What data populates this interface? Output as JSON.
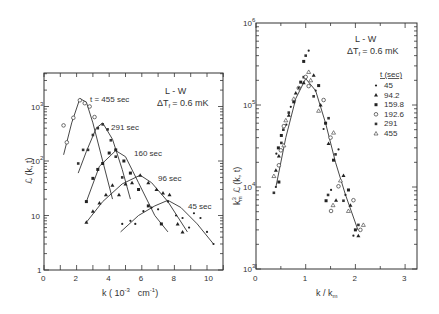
{
  "chart_data": [
    {
      "type": "scatter",
      "panel": "left",
      "title": "L - W",
      "subtitle": "ΔT_f = 0.6 mK",
      "xlabel": "k ( 10^-3  cm^-1 )",
      "ylabel": "ℒ (k, t)",
      "xlim": [
        0,
        11
      ],
      "ylim": [
        1,
        3000
      ],
      "yscale": "log",
      "xticks": [
        "0",
        "2",
        "4",
        "6",
        "8",
        "10"
      ],
      "yticks": [
        "1",
        "10",
        "10²",
        "10³"
      ],
      "series": [
        {
          "name": "t = 455 sec",
          "marker": "open-circle",
          "points": [
            [
              1.2,
              450
            ],
            [
              1.4,
              220
            ],
            [
              1.8,
              620
            ],
            [
              2.2,
              1300
            ],
            [
              2.5,
              1150
            ],
            [
              2.8,
              1000
            ],
            [
              3.1,
              640
            ]
          ],
          "curve": [
            [
              1.2,
              130
            ],
            [
              1.7,
              500
            ],
            [
              2.2,
              1400
            ],
            [
              2.6,
              1200
            ],
            [
              3.0,
              500
            ],
            [
              3.6,
              100
            ],
            [
              4.2,
              20
            ]
          ]
        },
        {
          "name": "291 sec",
          "marker": "square",
          "points": [
            [
              2.1,
              90
            ],
            [
              2.4,
              160
            ],
            [
              2.7,
              160
            ],
            [
              3.0,
              300
            ],
            [
              3.3,
              400
            ],
            [
              3.6,
              470
            ],
            [
              3.9,
              380
            ],
            [
              4.1,
              240
            ],
            [
              4.4,
              120
            ],
            [
              4.8,
              50
            ]
          ],
          "curve": [
            [
              2.1,
              60
            ],
            [
              2.6,
              150
            ],
            [
              3.2,
              400
            ],
            [
              3.6,
              500
            ],
            [
              4.2,
              250
            ],
            [
              4.8,
              70
            ],
            [
              5.3,
              20
            ]
          ]
        },
        {
          "name": "160 sec",
          "marker": "filled-square",
          "points": [
            [
              2.6,
              18
            ],
            [
              3.0,
              48
            ],
            [
              3.3,
              70
            ],
            [
              3.6,
              90
            ],
            [
              4.0,
              140
            ],
            [
              4.4,
              160
            ],
            [
              4.9,
              100
            ],
            [
              5.3,
              60
            ],
            [
              5.8,
              30
            ],
            [
              6.4,
              15
            ],
            [
              7.2,
              7
            ]
          ],
          "curve": [
            [
              2.6,
              18
            ],
            [
              3.4,
              80
            ],
            [
              4.4,
              155
            ],
            [
              5.0,
              120
            ],
            [
              5.8,
              40
            ],
            [
              6.8,
              10
            ],
            [
              7.6,
              5
            ]
          ]
        },
        {
          "name": "96 sec",
          "marker": "filled-triangle",
          "points": [
            [
              2.6,
              7.5
            ],
            [
              3.0,
              12
            ],
            [
              3.4,
              17
            ],
            [
              3.8,
              24
            ],
            [
              4.2,
              36
            ],
            [
              4.6,
              24
            ],
            [
              5.0,
              38
            ],
            [
              5.4,
              40
            ],
            [
              5.9,
              55
            ],
            [
              6.4,
              40
            ],
            [
              6.9,
              30
            ],
            [
              7.3,
              26
            ],
            [
              7.7,
              24
            ],
            [
              8.2,
              7
            ],
            [
              8.5,
              5
            ]
          ],
          "curve": [
            [
              2.6,
              7.5
            ],
            [
              3.6,
              18
            ],
            [
              4.8,
              38
            ],
            [
              5.9,
              55
            ],
            [
              6.6,
              40
            ],
            [
              7.6,
              18
            ],
            [
              8.8,
              5
            ]
          ]
        },
        {
          "name": "45 sec",
          "marker": "dot",
          "points": [
            [
              4.8,
              7
            ],
            [
              5.3,
              8
            ],
            [
              5.6,
              7
            ],
            [
              6.1,
              12
            ],
            [
              6.6,
              14
            ],
            [
              7.0,
              13
            ],
            [
              7.6,
              18
            ],
            [
              8.1,
              10
            ],
            [
              8.5,
              9
            ],
            [
              8.9,
              6
            ],
            [
              9.2,
              11
            ],
            [
              9.6,
              9
            ],
            [
              10.0,
              5
            ],
            [
              10.4,
              3
            ]
          ],
          "curve": [
            [
              4.7,
              5
            ],
            [
              5.8,
              10
            ],
            [
              6.8,
              15
            ],
            [
              7.6,
              19
            ],
            [
              8.4,
              14
            ],
            [
              9.4,
              7
            ],
            [
              10.4,
              3
            ]
          ]
        }
      ]
    },
    {
      "type": "scatter",
      "panel": "right",
      "title": "L - W",
      "subtitle": "ΔT_f = 0.6 mK",
      "xlabel": "k / k_m",
      "ylabel": "k_m³ ℒ (k, t)",
      "xlim": [
        0,
        3.2
      ],
      "ylim": [
        1000,
        1000000
      ],
      "yscale": "log",
      "xticks": [
        "0",
        "1",
        "2",
        "3"
      ],
      "yticks": [
        "10³",
        "10⁴",
        "10⁵",
        "10⁶"
      ],
      "legend_title": "t (sec)",
      "legend": [
        "45",
        "94.2",
        "159.8",
        "192.6",
        "291",
        "455"
      ],
      "series_points_approx": [
        [
          0.4,
          10000
        ],
        [
          0.4,
          16000
        ],
        [
          0.45,
          30000
        ],
        [
          0.5,
          28000
        ],
        [
          0.55,
          50000
        ],
        [
          0.6,
          65000
        ],
        [
          0.7,
          95000
        ],
        [
          0.8,
          140000
        ],
        [
          0.9,
          190000
        ],
        [
          1.0,
          220000
        ],
        [
          1.0,
          400000
        ],
        [
          1.1,
          200000
        ],
        [
          1.2,
          150000
        ],
        [
          1.3,
          100000
        ],
        [
          1.4,
          60000
        ],
        [
          1.5,
          40000
        ],
        [
          1.6,
          25000
        ],
        [
          1.7,
          12000
        ],
        [
          1.8,
          8000
        ],
        [
          1.9,
          6000
        ],
        [
          2.0,
          3000
        ],
        [
          2.1,
          3000
        ],
        [
          1.45,
          8000
        ],
        [
          1.55,
          6000
        ]
      ],
      "curve": [
        [
          0.4,
          10000
        ],
        [
          0.6,
          40000
        ],
        [
          0.8,
          120000
        ],
        [
          1.0,
          210000
        ],
        [
          1.2,
          150000
        ],
        [
          1.4,
          60000
        ],
        [
          1.6,
          20000
        ],
        [
          1.8,
          8000
        ],
        [
          2.05,
          3000
        ]
      ]
    }
  ],
  "labels": {
    "left": {
      "title": "L - W",
      "subtitle": "ΔT",
      "subtitle_sub": "f",
      "subtitle_val": "= 0.6 mK",
      "ylabel": "ℒ (k, t)",
      "xlabel": "k ( 10",
      "xlabel_exp": "-3",
      "xlabel_tail": "cm",
      "xlabel_tail_exp": "-1",
      "xlabel_close": ")",
      "series_labels": [
        "t = 455 sec",
        "291 sec",
        "160 sec",
        "96 sec",
        "45 sec"
      ],
      "xticks": [
        "0",
        "2",
        "4",
        "6",
        "8",
        "10"
      ],
      "ytick_base": "10",
      "yticks": [
        {
          "base": "1",
          "exp": ""
        },
        {
          "base": "10",
          "exp": ""
        },
        {
          "base": "10",
          "exp": "2"
        },
        {
          "base": "10",
          "exp": "3"
        }
      ]
    },
    "right": {
      "title": "L - W",
      "subtitle": "ΔT",
      "subtitle_sub": "f",
      "subtitle_val": "= 0.6 mK",
      "ylabel_pre": "k",
      "ylabel_pre_sup": "3",
      "ylabel_pre_sub": "m",
      "ylabel": "ℒ (k, t)",
      "xlabel": "k / k",
      "xlabel_sub": "m",
      "legend_title": "t (sec)",
      "legend": [
        "45",
        "94.2",
        "159.8",
        "192.6",
        "291",
        "455"
      ],
      "xticks": [
        "0",
        "1",
        "2",
        "3"
      ],
      "yticks": [
        {
          "base": "10",
          "exp": "3"
        },
        {
          "base": "10",
          "exp": "4"
        },
        {
          "base": "10",
          "exp": "5"
        },
        {
          "base": "10",
          "exp": "6"
        }
      ]
    }
  }
}
